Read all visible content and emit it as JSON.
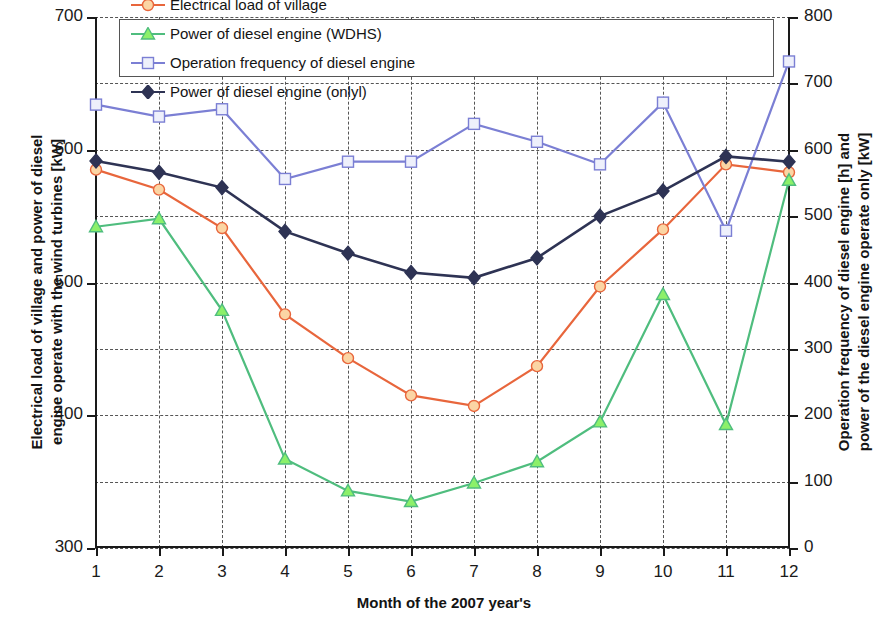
{
  "chart_data": {
    "type": "line",
    "title": "",
    "xlabel": "Month of the 2007 year's",
    "ylabel_left": "Electrical load of village and power of diesel engine operate with the wind turbines [kW]",
    "ylabel_left_line1": "Electrical load of village and power of diesel",
    "ylabel_left_line2": "engine operate with the wind turbines [kW]",
    "ylabel_right": "Operation frequency of diesel engine [h] and power of the diesel engine operate only [kW]",
    "ylabel_right_line1": "Operation frequency of diesel engine [h] and",
    "ylabel_right_line2": "power of the diesel engine operate only [kW]",
    "categories": [
      "1",
      "2",
      "3",
      "4",
      "5",
      "6",
      "7",
      "8",
      "9",
      "10",
      "11",
      "12"
    ],
    "x": [
      1,
      2,
      3,
      4,
      5,
      6,
      7,
      8,
      9,
      10,
      11,
      12
    ],
    "ylim_left": [
      300,
      700
    ],
    "ylim_right": [
      0,
      800
    ],
    "ytick_labels_left": [
      "300",
      "400",
      "500",
      "600",
      "700"
    ],
    "ytick_values_left": [
      300,
      400,
      500,
      600,
      700
    ],
    "ytick_labels_right": [
      "0",
      "100",
      "200",
      "300",
      "400",
      "500",
      "600",
      "700",
      "800"
    ],
    "ytick_values_right": [
      0,
      100,
      200,
      300,
      400,
      500,
      600,
      700,
      800
    ],
    "grid": true,
    "grid_left_minor_step": 50,
    "legend_position": "top-inside",
    "series": [
      {
        "name": "Electrical load of village",
        "axis": "left",
        "color": "#e8663c",
        "marker": "circle",
        "marker_fill": "#fbd5a4",
        "values": [
          585,
          570,
          541,
          476,
          443,
          415,
          407,
          437,
          497,
          540,
          589,
          583
        ]
      },
      {
        "name": "Operation frequency of diesel engine",
        "axis": "right",
        "color": "#7b7fd4",
        "marker": "square",
        "marker_fill": "#eef0fb",
        "values": [
          668,
          650,
          661,
          556,
          582,
          582,
          639,
          612,
          578,
          671,
          478,
          733
        ]
      },
      {
        "name": "Power of diesel engine (WDHS)",
        "axis": "left",
        "color": "#4fbd7e",
        "marker": "triangle",
        "marker_fill": "#8cf06a",
        "values": [
          542,
          548,
          479,
          367,
          343,
          335,
          349,
          365,
          395,
          491,
          393,
          577
        ]
      },
      {
        "name": "Power of diesel engine (onlyl)",
        "axis": "right",
        "color": "#2e3354",
        "marker": "diamond",
        "marker_fill": "#2e3354",
        "values": [
          583,
          566,
          543,
          477,
          444,
          415,
          407,
          437,
          500,
          538,
          590,
          582
        ]
      }
    ]
  },
  "legend": {
    "items": [
      {
        "label": "Electrical load of village"
      },
      {
        "label": "Power of diesel engine (WDHS)"
      },
      {
        "label": "Operation frequency of diesel engine"
      },
      {
        "label": "Power of diesel engine (onlyl)"
      }
    ]
  }
}
